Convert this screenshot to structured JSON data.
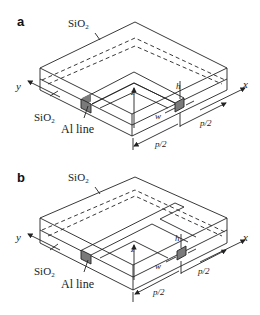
{
  "figure": {
    "panels": [
      {
        "id": "a",
        "label": "a",
        "top_layer_label": "SiO",
        "top_layer_sub": "2",
        "bottom_layer_label": "SiO",
        "bottom_layer_sub": "2",
        "line_label": "Al line",
        "axis_x": "x",
        "axis_y": "y",
        "axis_z": "z",
        "dim_h": "h",
        "dim_w": "w",
        "dim_p_right": "p/2",
        "dim_p_front": "p/2",
        "shape": "L-shaped corner line"
      },
      {
        "id": "b",
        "label": "b",
        "top_layer_label": "SiO",
        "top_layer_sub": "2",
        "bottom_layer_label": "SiO",
        "bottom_layer_sub": "2",
        "line_label": "Al line",
        "axis_x": "x",
        "axis_y": "y",
        "axis_z": "z",
        "dim_h": "h",
        "dim_w": "w",
        "dim_p_right": "p/2",
        "dim_p_front": "p/2",
        "shape": "T-shaped junction line"
      }
    ],
    "colors": {
      "line": "#222222",
      "al_fill": "#7a7a7a",
      "background": "#ffffff"
    }
  }
}
